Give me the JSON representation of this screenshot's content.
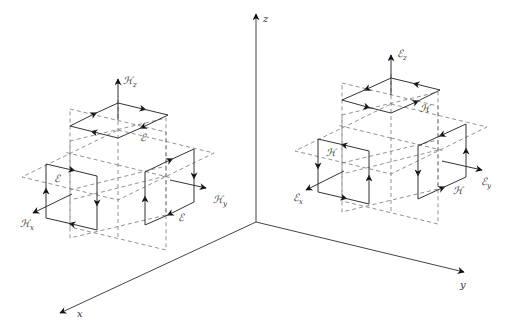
{
  "diagram": {
    "axes": {
      "origin": [
        256,
        222
      ],
      "x": {
        "label": "x",
        "tip": [
          58,
          314
        ]
      },
      "y": {
        "label": "y",
        "tip": [
          466,
          273
        ]
      },
      "z": {
        "label": "z",
        "tip": [
          256,
          12
        ]
      }
    },
    "left_cell": {
      "title": "H-field components with E circulation",
      "center": [
        118,
        165
      ],
      "arrows": [
        {
          "id": "Hz",
          "label": "ℋ",
          "sub": "z"
        },
        {
          "id": "Hx",
          "label": "ℋ",
          "sub": "x"
        },
        {
          "id": "Hy",
          "label": "ℋ",
          "sub": "y"
        }
      ],
      "loop_labels": [
        "ℰ",
        "ℰ",
        "ℰ"
      ]
    },
    "right_cell": {
      "title": "E-field components with H circulation",
      "center": [
        391,
        138
      ],
      "arrows": [
        {
          "id": "Ez",
          "label": "ℰ",
          "sub": "z"
        },
        {
          "id": "Ex",
          "label": "ℰ",
          "sub": "x"
        },
        {
          "id": "Ey",
          "label": "ℰ",
          "sub": "y"
        }
      ],
      "loop_labels": [
        "ℋ",
        "ℋ",
        "ℋ"
      ]
    },
    "colors": {
      "line": "#333333",
      "dashed": "#777777",
      "arrowhead": "#111111",
      "background": "#ffffff"
    }
  }
}
